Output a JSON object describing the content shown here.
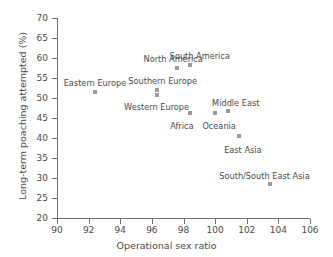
{
  "chart_data": {
    "type": "scatter",
    "title": "",
    "xlabel": "Operational sex ratio",
    "ylabel": "Long-term poaching attempted (%)",
    "xlim": [
      90,
      106
    ],
    "ylim": [
      20,
      70
    ],
    "xticks": [
      90,
      92,
      94,
      96,
      98,
      100,
      102,
      104,
      106
    ],
    "yticks": [
      20,
      25,
      30,
      35,
      40,
      45,
      50,
      55,
      60,
      65,
      70
    ],
    "grid": false,
    "legend": "none",
    "marker_color": "#9a9a9a",
    "axis_color": "#6e6e6e",
    "text_color": "#4a4a4a",
    "points": [
      {
        "label": "Eastern Europe",
        "x": 92.4,
        "y": 51.5,
        "label_dx": 0,
        "label_dy": -13
      },
      {
        "label": "North America",
        "x": 97.6,
        "y": 57.4,
        "label_dx": -4,
        "label_dy": -13
      },
      {
        "label": "South America",
        "x": 98.4,
        "y": 58.3,
        "label_dx": 10,
        "label_dy": -13
      },
      {
        "label": "Southern Europe",
        "x": 96.3,
        "y": 52.0,
        "label_dx": 6,
        "label_dy": -13
      },
      {
        "label": "Western Europe",
        "x": 96.3,
        "y": 50.8,
        "label_dx": 0,
        "label_dy": 8
      },
      {
        "label": "Africa",
        "x": 98.4,
        "y": 46.2,
        "label_dx": -8,
        "label_dy": 9
      },
      {
        "label": "Oceania",
        "x": 100.0,
        "y": 46.2,
        "label_dx": 4,
        "label_dy": 9
      },
      {
        "label": "Middle East",
        "x": 100.8,
        "y": 46.7,
        "label_dx": 8,
        "label_dy": -12
      },
      {
        "label": "East Asia",
        "x": 101.5,
        "y": 40.4,
        "label_dx": 4,
        "label_dy": 10
      },
      {
        "label": "South/South East Asia",
        "x": 103.5,
        "y": 28.4,
        "label_dx": -6,
        "label_dy": -12
      }
    ]
  }
}
